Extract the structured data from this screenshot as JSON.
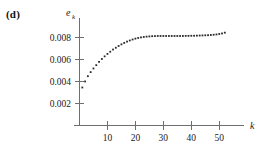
{
  "panel": {
    "label": "(d)"
  },
  "chart_data": {
    "type": "scatter",
    "title": "",
    "subtitle": "",
    "xlabel": "k",
    "ylabel": "e",
    "ylabel_subscript": "k",
    "xlabel_full": "k",
    "ylabel_full": "e_k",
    "grid": false,
    "legend": false,
    "legend_position": "none",
    "marker": "square-dot",
    "marker_color": "#2b2b2b",
    "axis_color": "#6e6e6e",
    "xlim": [
      0,
      56
    ],
    "ylim": [
      0,
      0.0094
    ],
    "xticks": [
      10,
      20,
      30,
      40,
      50
    ],
    "xticklabels": [
      "10",
      "20",
      "30",
      "40",
      "50"
    ],
    "yticks": [
      0.002,
      0.004,
      0.006,
      0.008
    ],
    "yticklabels": [
      "0.002",
      "0.004",
      "0.006",
      "0.008"
    ],
    "x": [
      1,
      2,
      3,
      4,
      5,
      6,
      7,
      8,
      9,
      10,
      11,
      12,
      13,
      14,
      15,
      16,
      17,
      18,
      19,
      20,
      21,
      22,
      23,
      24,
      25,
      26,
      27,
      28,
      29,
      30,
      31,
      32,
      33,
      34,
      35,
      36,
      37,
      38,
      39,
      40,
      41,
      42,
      43,
      44,
      45,
      46,
      47,
      48,
      49,
      50,
      51,
      52
    ],
    "y": [
      0.00345,
      0.004,
      0.00448,
      0.00485,
      0.00518,
      0.00548,
      0.00578,
      0.00604,
      0.00628,
      0.0065,
      0.0067,
      0.0069,
      0.00706,
      0.00722,
      0.00737,
      0.0075,
      0.00762,
      0.00772,
      0.00781,
      0.00789,
      0.00795,
      0.008,
      0.00804,
      0.00807,
      0.00809,
      0.00811,
      0.00812,
      0.00813,
      0.00813,
      0.00813,
      0.00813,
      0.00813,
      0.00813,
      0.00813,
      0.00813,
      0.00813,
      0.00813,
      0.00814,
      0.00814,
      0.00815,
      0.00815,
      0.00816,
      0.00817,
      0.00818,
      0.00819,
      0.0082,
      0.00822,
      0.00824,
      0.00827,
      0.00831,
      0.00836,
      0.00843
    ]
  }
}
